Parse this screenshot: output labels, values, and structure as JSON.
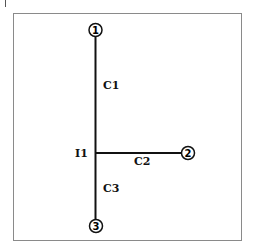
{
  "diagram": {
    "nodes": [
      {
        "id": "1",
        "label": "1",
        "x": 95,
        "y": 30
      },
      {
        "id": "2",
        "label": "2",
        "x": 188,
        "y": 152
      },
      {
        "id": "3",
        "label": "3",
        "x": 96,
        "y": 226
      }
    ],
    "junction": {
      "label": "I1",
      "x": 96,
      "y": 153
    },
    "edges": [
      {
        "label": "C1",
        "from": "1",
        "to": "I1"
      },
      {
        "label": "C2",
        "from": "I1",
        "to": "2"
      },
      {
        "label": "C3",
        "from": "I1",
        "to": "3"
      }
    ]
  },
  "colors": {
    "line": "#111111",
    "frame": "#8a8a8a"
  }
}
